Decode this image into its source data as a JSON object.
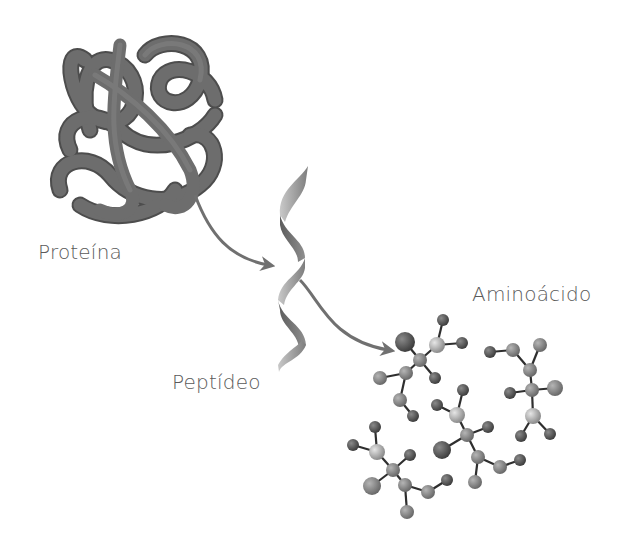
{
  "diagram": {
    "nodes": [
      {
        "id": "protein",
        "label": "Proteína",
        "shape": "tangled-tube"
      },
      {
        "id": "peptide",
        "label": "Peptídeo",
        "shape": "helix-ribbon"
      },
      {
        "id": "amino_acid",
        "label": "Aminoácido",
        "shape": "ball-and-stick-molecules"
      }
    ],
    "edges": [
      {
        "from": "protein",
        "to": "peptide"
      },
      {
        "from": "peptide",
        "to": "amino_acid"
      }
    ]
  },
  "labels": {
    "protein": "Proteína",
    "peptide": "Peptídeo",
    "amino_acid": "Aminoácido"
  },
  "colors": {
    "tube": "#6b6b6b",
    "tube_dark": "#4a4a4a",
    "arrow": "#707070",
    "atom_light": "#b8b8b8",
    "atom_mid": "#8a8a8a",
    "atom_dark": "#555555",
    "text": "#5a5a5a"
  }
}
